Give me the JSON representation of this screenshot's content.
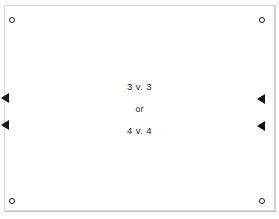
{
  "diagram": {
    "background_color": "#ffffff",
    "frame": {
      "border_color": "#d6d6d8",
      "fill_color": "#ffffff"
    },
    "center_text": {
      "line1": "3 v. 3",
      "conjunction": "or",
      "line2": "4 v. 4"
    },
    "corner_markers": [
      {
        "name": "corner-marker-top-left",
        "position": "top-left",
        "shape": "circle",
        "color": "#1b1b1b"
      },
      {
        "name": "corner-marker-top-right",
        "position": "top-right",
        "shape": "circle",
        "color": "#1b1b1b"
      },
      {
        "name": "corner-marker-bottom-left",
        "position": "bottom-left",
        "shape": "circle",
        "color": "#1b1b1b"
      },
      {
        "name": "corner-marker-bottom-right",
        "position": "bottom-right",
        "shape": "circle",
        "color": "#1b1b1b"
      }
    ],
    "edge_arrows": [
      {
        "name": "arrow-left-upper",
        "side": "left",
        "direction": "left",
        "color": "#141414"
      },
      {
        "name": "arrow-left-lower",
        "side": "left",
        "direction": "left",
        "color": "#141414"
      },
      {
        "name": "arrow-right-upper",
        "side": "right",
        "direction": "left",
        "color": "#141414"
      },
      {
        "name": "arrow-right-lower",
        "side": "right",
        "direction": "left",
        "color": "#141414"
      }
    ]
  }
}
